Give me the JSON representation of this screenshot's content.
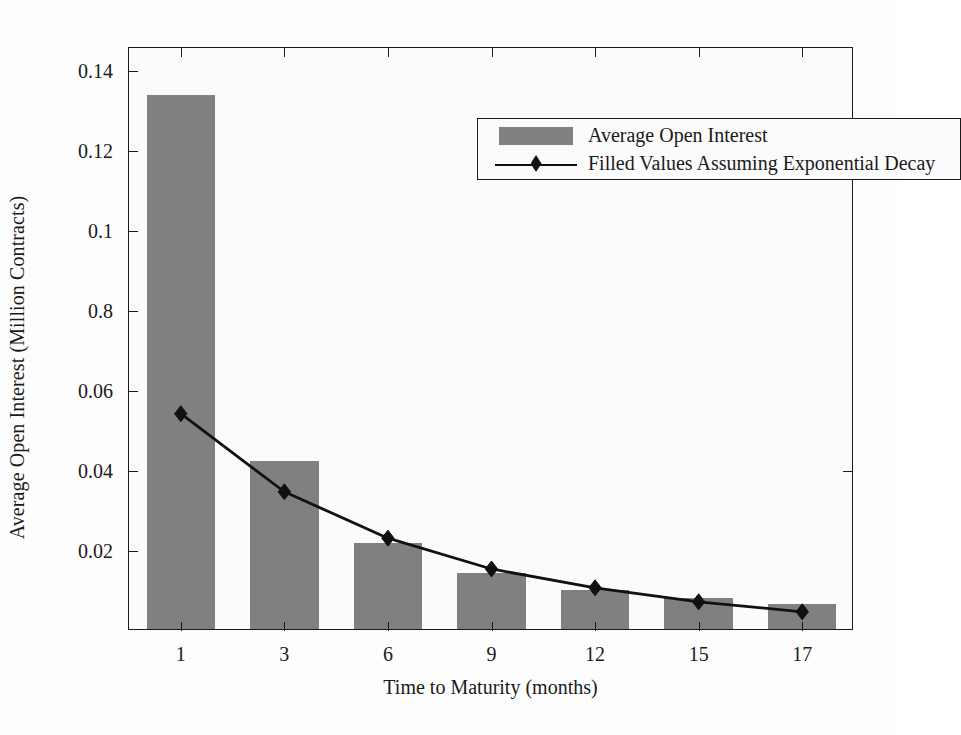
{
  "chart_data": {
    "type": "bar",
    "title": "",
    "xlabel": "Time to Maturity (months)",
    "ylabel": "Average Open Interest (Million Contracts)",
    "categories": [
      "1",
      "3",
      "6",
      "9",
      "12",
      "15",
      "17"
    ],
    "x": [
      1,
      3,
      6,
      9,
      12,
      15,
      17
    ],
    "xtick_labels": [
      "1",
      "3",
      "6",
      "9",
      "12",
      "15",
      "17"
    ],
    "ytick_labels": [
      "0.02",
      "0.04",
      "0.06",
      "0.8",
      "0.1",
      "0.12",
      "0.14"
    ],
    "ytick_values": [
      0.02,
      0.04,
      0.06,
      0.08,
      0.1,
      0.12,
      0.14
    ],
    "ylim": [
      0,
      0.1457
    ],
    "xlim": [
      0,
      7
    ],
    "grid": false,
    "legend_position": "top-center-right",
    "series": [
      {
        "name": "Average Open Interest",
        "kind": "bar",
        "color": "#808080",
        "values": [
          0.1335,
          0.0421,
          0.0215,
          0.014,
          0.0098,
          0.0078,
          0.0062
        ]
      },
      {
        "name": "Filled Values Assuming Exponential Decay",
        "kind": "line",
        "color": "#111111",
        "marker": "diamond",
        "values": [
          0.0543,
          0.0348,
          0.0232,
          0.0155,
          0.0108,
          0.0073,
          0.0048
        ]
      }
    ]
  },
  "legend": {
    "entries": [
      {
        "label": "Average Open Interest",
        "key": "swatch"
      },
      {
        "label": "Filled Values Assuming Exponential Decay",
        "key": "line-marker"
      }
    ]
  },
  "colors": {
    "bar": "#808080",
    "line": "#111111",
    "axis": "#1a1a1a",
    "plot_background": "#fbfbfb",
    "figure_background": "#fdfdfd"
  }
}
